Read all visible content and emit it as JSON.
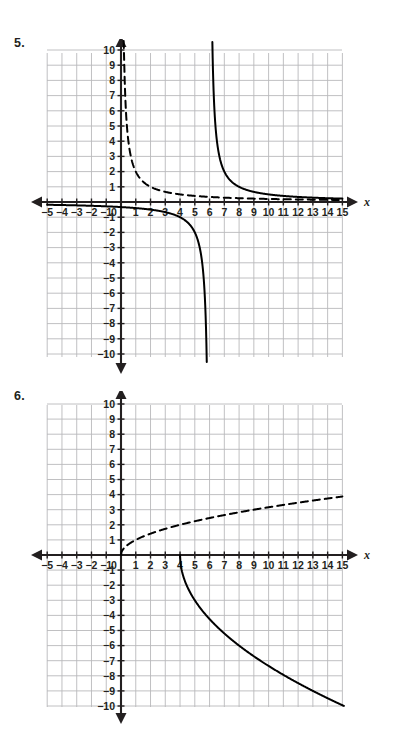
{
  "page": {
    "width": 400,
    "height": 739,
    "background": "#ffffff",
    "ink_color": "#231f20",
    "grid_color": "#b9b9bb",
    "curve_color": "#000000"
  },
  "problems": [
    {
      "number_label": "5.",
      "number_pos": {
        "x": 14,
        "y": 36
      },
      "graph": {
        "name": "graph-problem-5",
        "origin_px": {
          "x": 121,
          "y": 202
        },
        "grid_rect_px": {
          "left": 47,
          "top": 53,
          "right": 342,
          "bottom": 357
        },
        "unit_px": {
          "x": 14.76,
          "y": 15.2
        },
        "x_axis_label": "x",
        "y_axis_label": "y",
        "x_range": [
          -5,
          15
        ],
        "y_range": [
          -10,
          10
        ],
        "x_ticks": [
          "-5",
          "-4",
          "-3",
          "-2",
          "-1",
          "0",
          "1",
          "2",
          "3",
          "4",
          "5",
          "6",
          "7",
          "8",
          "9",
          "10",
          "11",
          "12",
          "13",
          "14",
          "15"
        ],
        "y_ticks": [
          "10",
          "9",
          "8",
          "7",
          "6",
          "5",
          "4",
          "3",
          "2",
          "1",
          "-1",
          "-2",
          "-3",
          "-4",
          "-5",
          "-6",
          "-7",
          "-8",
          "-9",
          "-10"
        ],
        "zero_tick_label": "0",
        "curves": [
          {
            "name": "dashed-reciprocal-parent-curve",
            "style": "dashed",
            "description": "y = 2/x, vertical asymptote x = 0, horizontal asymptote y = 0",
            "kind": "reciprocal",
            "a": 2,
            "h": 0,
            "k": 0,
            "domain": [
              0.18,
              15
            ]
          },
          {
            "name": "solid-reciprocal-upper-branch",
            "style": "solid",
            "description": "y = 2/(x - 6), upper right branch, vertical asymptote x = 6",
            "kind": "reciprocal",
            "a": 2,
            "h": 6,
            "k": 0,
            "domain": [
              6.19,
              15
            ]
          },
          {
            "name": "solid-reciprocal-lower-branch",
            "style": "solid",
            "description": "y = 2/(x - 6), lower left branch, vertical asymptote x = 6",
            "kind": "reciprocal",
            "a": 2,
            "h": 6,
            "k": 0,
            "domain": [
              -5,
              5.81
            ]
          }
        ]
      }
    },
    {
      "number_label": "6.",
      "number_pos": {
        "x": 14,
        "y": 389
      },
      "graph": {
        "name": "graph-problem-6",
        "origin_px": {
          "x": 121,
          "y": 555
        },
        "grid_rect_px": {
          "left": 47,
          "top": 405,
          "right": 342,
          "bottom": 707
        },
        "unit_px": {
          "x": 14.76,
          "y": 15.1
        },
        "x_axis_label": "x",
        "y_axis_label": "y",
        "x_range": [
          -5,
          15
        ],
        "y_range": [
          -10,
          10
        ],
        "x_ticks": [
          "-5",
          "-4",
          "-3",
          "-2",
          "-1",
          "0",
          "1",
          "2",
          "3",
          "4",
          "5",
          "6",
          "7",
          "8",
          "9",
          "10",
          "11",
          "12",
          "13",
          "14",
          "15"
        ],
        "y_ticks": [
          "10",
          "9",
          "8",
          "7",
          "6",
          "5",
          "4",
          "3",
          "2",
          "1",
          "-1",
          "-2",
          "-3",
          "-4",
          "-5",
          "-6",
          "-7",
          "-8",
          "-9",
          "-10"
        ],
        "zero_tick_label": "0",
        "curves": [
          {
            "name": "dashed-square-root-parent-curve",
            "style": "dashed",
            "description": "y = sqrt(x), starts at origin, rises to about 3.9 at x = 15",
            "kind": "sqrt",
            "a": 1,
            "h": 0,
            "k": 0,
            "domain": [
              0,
              15
            ]
          },
          {
            "name": "solid-reflected-square-root-curve",
            "style": "solid",
            "description": "y = -3*sqrt(x - 4), starts at (4, 0), falls to about -10 at x = 15",
            "kind": "neg-sqrt",
            "a": -3,
            "h": 4,
            "k": 0,
            "domain": [
              4,
              15.1
            ]
          }
        ]
      }
    }
  ],
  "chart_data": [
    {
      "type": "line",
      "title": "5.",
      "xlabel": "x",
      "ylabel": "y",
      "xlim": [
        -5,
        15
      ],
      "ylim": [
        -10,
        10
      ],
      "grid": true,
      "xticks": [
        -5,
        -4,
        -3,
        -2,
        -1,
        0,
        1,
        2,
        3,
        4,
        5,
        6,
        7,
        8,
        9,
        10,
        11,
        12,
        13,
        14,
        15
      ],
      "yticks": [
        -10,
        -9,
        -8,
        -7,
        -6,
        -5,
        -4,
        -3,
        -2,
        -1,
        1,
        2,
        3,
        4,
        5,
        6,
        7,
        8,
        9,
        10
      ],
      "legend": "none",
      "series": [
        {
          "name": "y = 2/x (dashed parent function)",
          "linestyle": "dashed",
          "x": [
            0.2,
            0.25,
            0.3,
            0.4,
            0.5,
            0.667,
            0.8,
            1,
            1.25,
            1.6,
            2,
            2.5,
            3,
            4,
            5,
            6,
            8,
            10,
            12,
            15
          ],
          "y": [
            10,
            8,
            6.67,
            5,
            4,
            3,
            2.5,
            2,
            1.6,
            1.25,
            1,
            0.8,
            0.667,
            0.5,
            0.4,
            0.333,
            0.25,
            0.2,
            0.167,
            0.133
          ]
        },
        {
          "name": "y = 2/(x-6) upper branch (solid)",
          "linestyle": "solid",
          "x": [
            6.2,
            6.25,
            6.33,
            6.5,
            6.67,
            7,
            7.5,
            8,
            9,
            10,
            11,
            12,
            13,
            14,
            15
          ],
          "y": [
            10,
            8,
            6.06,
            4,
            3,
            2,
            1.33,
            1,
            0.667,
            0.5,
            0.4,
            0.333,
            0.286,
            0.25,
            0.222
          ]
        },
        {
          "name": "y = 2/(x-6) lower branch (solid)",
          "linestyle": "solid",
          "x": [
            -5,
            -3,
            -1,
            0,
            1,
            2,
            3,
            4,
            4.5,
            5,
            5.33,
            5.5,
            5.67,
            5.75,
            5.8
          ],
          "y": [
            -0.182,
            -0.222,
            -0.286,
            -0.333,
            -0.4,
            -0.5,
            -0.667,
            -1,
            -1.33,
            -2,
            -3,
            -4,
            -6.06,
            -8,
            -10
          ]
        }
      ]
    },
    {
      "type": "line",
      "title": "6.",
      "xlabel": "x",
      "ylabel": "y",
      "xlim": [
        -5,
        15
      ],
      "ylim": [
        -10,
        10
      ],
      "grid": true,
      "xticks": [
        -5,
        -4,
        -3,
        -2,
        -1,
        0,
        1,
        2,
        3,
        4,
        5,
        6,
        7,
        8,
        9,
        10,
        11,
        12,
        13,
        14,
        15
      ],
      "yticks": [
        -10,
        -9,
        -8,
        -7,
        -6,
        -5,
        -4,
        -3,
        -2,
        -1,
        1,
        2,
        3,
        4,
        5,
        6,
        7,
        8,
        9,
        10
      ],
      "legend": "none",
      "series": [
        {
          "name": "y = sqrt(x) (dashed parent function)",
          "linestyle": "dashed",
          "x": [
            0,
            0.25,
            1,
            2,
            3,
            4,
            5,
            6,
            7,
            8,
            9,
            10,
            11,
            12,
            13,
            14,
            15
          ],
          "y": [
            0,
            0.5,
            1,
            1.41,
            1.73,
            2,
            2.24,
            2.45,
            2.65,
            2.83,
            3,
            3.16,
            3.32,
            3.46,
            3.61,
            3.74,
            3.87
          ]
        },
        {
          "name": "y = -3*sqrt(x-4) (solid)",
          "linestyle": "solid",
          "x": [
            4,
            4.25,
            4.5,
            5,
            5.5,
            6,
            7,
            8,
            9,
            10,
            11,
            12,
            13,
            14,
            15,
            15.1
          ],
          "y": [
            0,
            -1.5,
            -2.12,
            -3,
            -3.67,
            -4.24,
            -5.2,
            -6,
            -6.71,
            -7.35,
            -7.94,
            -8.49,
            -9,
            -9.49,
            -9.95,
            -10
          ]
        }
      ]
    }
  ]
}
